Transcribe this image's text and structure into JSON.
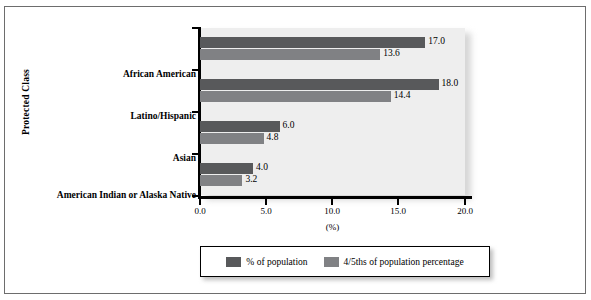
{
  "chart_data": {
    "type": "bar",
    "orientation": "horizontal",
    "title": "",
    "xlabel": "(%)",
    "ylabel": "Protected Class",
    "categories": [
      "African American",
      "Latino/Hispanic",
      "Asian",
      "American Indian or Alaska Native"
    ],
    "series": [
      {
        "name": "% of population",
        "color": "#58595b",
        "values": [
          17.0,
          18.0,
          6.0,
          4.0
        ],
        "labels": [
          "17.0",
          "18.0",
          "6.0",
          "4.0"
        ]
      },
      {
        "name": "4/5ths of population percentage",
        "color": "#808184",
        "values": [
          13.6,
          14.4,
          4.8,
          3.2
        ],
        "labels": [
          "13.6",
          "14.4",
          "4.8",
          "3.2"
        ]
      }
    ],
    "xlim": [
      0.0,
      20.0
    ],
    "xticks": [
      0.0,
      5.0,
      10.0,
      15.0,
      20.0
    ],
    "xtick_labels": [
      "0.0",
      "5.0",
      "10.0",
      "15.0",
      "20.0"
    ],
    "grid": false,
    "legend_position": "bottom",
    "plot_background": "#eeeeee",
    "figure_background": "#ffffff"
  },
  "axes": {
    "y_title": "Protected Class",
    "x_title": "(%)"
  },
  "legend": {
    "entries": [
      {
        "label": "% of population",
        "color": "#58595b"
      },
      {
        "label": "4/5ths of population percentage",
        "color": "#808184"
      }
    ]
  }
}
